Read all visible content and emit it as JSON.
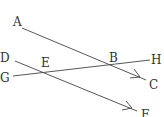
{
  "diagram": {
    "type": "parallel-lines-with-transversal",
    "colors": {
      "line": "#444444",
      "label": "#333333",
      "background": "#ffffff"
    },
    "points": {
      "A": {
        "label": "A",
        "x": 13,
        "y": 22
      },
      "B": {
        "label": "B",
        "x": 113,
        "y": 57
      },
      "C": {
        "label": "C",
        "x": 155,
        "y": 88
      },
      "D": {
        "label": "D",
        "x": 5,
        "y": 61
      },
      "E": {
        "label": "E",
        "x": 44,
        "y": 66
      },
      "F": {
        "label": "F",
        "x": 145,
        "y": 117
      },
      "G": {
        "label": "G",
        "x": 4,
        "y": 81
      },
      "H": {
        "label": "H",
        "x": 154,
        "y": 64
      }
    },
    "segments": [
      {
        "name": "AC",
        "from": [
          22,
          28
        ],
        "to": [
          146,
          80
        ],
        "arrow_at": [
          135,
          75
        ]
      },
      {
        "name": "DF",
        "from": [
          15,
          61
        ],
        "to": [
          137,
          111
        ],
        "arrow_at": [
          128,
          107
        ]
      },
      {
        "name": "GH",
        "from": [
          13,
          76
        ],
        "to": [
          150,
          60
        ]
      }
    ]
  }
}
